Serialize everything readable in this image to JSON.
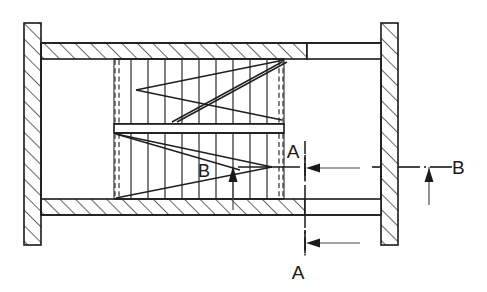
{
  "drawing": {
    "type": "cross-sectional-engineering-drawing",
    "title": "",
    "background_color": "#ffffff",
    "line_color": "#1a1a1a",
    "labels": {
      "section_a_top": "A",
      "section_a_bottom": "A",
      "section_b_right": "B",
      "detail_b_inner": "B"
    },
    "annotations": [
      {
        "name": "section-marker-a-top",
        "text": "A",
        "x": 305,
        "y": 159,
        "arrow": "left"
      },
      {
        "name": "section-marker-a-bottom",
        "text": "A",
        "x": 305,
        "y": 270,
        "arrow": "left"
      },
      {
        "name": "section-marker-b-right",
        "text": "B",
        "x": 456,
        "y": 167,
        "arrow": "up"
      },
      {
        "name": "detail-label-b",
        "text": "B",
        "x": 211,
        "y": 176,
        "arrow": "up"
      }
    ],
    "geometry": {
      "left_flange": {
        "x": 24,
        "y": 23,
        "width": 17,
        "height": 222
      },
      "right_flange": {
        "x": 381,
        "y": 23,
        "width": 17,
        "height": 222
      },
      "top_wall": {
        "x": 41,
        "y": 43,
        "width": 266,
        "height": 16
      },
      "bottom_wall": {
        "x": 41,
        "y": 199,
        "width": 264,
        "height": 16
      },
      "top_wall_plain": {
        "x": 307,
        "y": 43,
        "width": 74,
        "height": 16
      },
      "bottom_wall_plain": {
        "x": 305,
        "y": 199,
        "width": 76,
        "height": 16
      },
      "coil_region": {
        "x": 114,
        "y": 59,
        "width": 170,
        "height": 140
      },
      "divider_bar": {
        "x": 114,
        "y": 124,
        "width": 170,
        "height": 9
      },
      "upper_coil": {
        "x": 114,
        "y": 59,
        "width": 170,
        "height": 65
      },
      "lower_coil": {
        "x": 114,
        "y": 133,
        "width": 170,
        "height": 66
      },
      "coil_vertical_bar_count": 9,
      "hatch_angle_degrees": 45
    },
    "centerlines": {
      "horizontal_y": 167,
      "vertical_a_x": 305,
      "vertical_b_x": 456
    }
  }
}
